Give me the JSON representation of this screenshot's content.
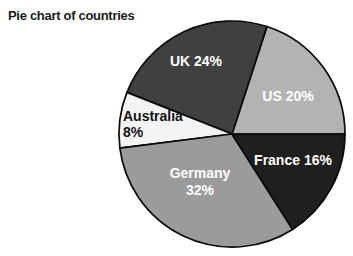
{
  "chart_data": {
    "type": "pie",
    "title": "Pie chart of countries",
    "unit": "%",
    "categories": [
      "US",
      "UK",
      "Australia",
      "Germany",
      "France"
    ],
    "values": [
      20,
      24,
      8,
      32,
      16
    ],
    "legend": "none",
    "slices": [
      {
        "name": "US",
        "value": 20,
        "color": "#b3b3b3",
        "text_color": "#ffffff",
        "label_lines": [
          "US 20%"
        ],
        "label": {
          "x": 288,
          "y": 101,
          "anchor": "middle",
          "line_height": 17
        }
      },
      {
        "name": "UK",
        "value": 24,
        "color": "#404040",
        "text_color": "#ffffff",
        "label_lines": [
          "UK 24%"
        ],
        "label": {
          "x": 196,
          "y": 66,
          "anchor": "middle",
          "line_height": 17
        }
      },
      {
        "name": "Australia",
        "value": 8,
        "color": "#f3f3f3",
        "text_color": "#141414",
        "label_lines": [
          "Australia",
          "8%"
        ],
        "label": {
          "x": 123,
          "y": 121,
          "anchor": "start",
          "line_height": 16
        }
      },
      {
        "name": "Germany",
        "value": 32,
        "color": "#9b9b9b",
        "text_color": "#ffffff",
        "label_lines": [
          "Germany",
          "32%"
        ],
        "label": {
          "x": 200,
          "y": 178,
          "anchor": "middle",
          "line_height": 17
        }
      },
      {
        "name": "France",
        "value": 16,
        "color": "#1f1f1f",
        "text_color": "#ffffff",
        "label_lines": [
          "France 16%"
        ],
        "label": {
          "x": 293,
          "y": 165,
          "anchor": "middle",
          "line_height": 17
        }
      }
    ],
    "layout": {
      "direction": "counterclockwise",
      "start_angle_deg": 0,
      "center_x": 232,
      "center_y": 134,
      "radius": 113,
      "stroke_color": "#0a0a0a",
      "stroke_width": 1.7
    }
  }
}
